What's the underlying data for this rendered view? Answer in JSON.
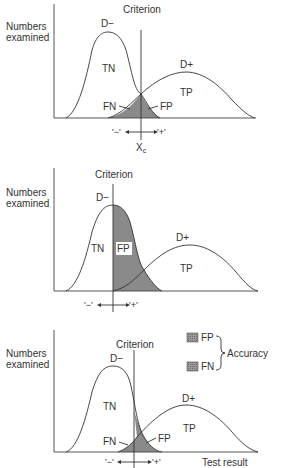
{
  "panels": [
    {
      "y_label_line1": "Numbers",
      "y_label_line2": "examined",
      "criterion_label": "Criterion",
      "d_minus": "D−",
      "d_plus": "D+",
      "tn": "TN",
      "tp": "TP",
      "fn": "FN",
      "fp": "FP",
      "neg_marker": "'−'",
      "pos_marker": "'+'",
      "criterion_value_label": "X",
      "criterion_value_sub": "c"
    },
    {
      "y_label_line1": "Numbers",
      "y_label_line2": "examined",
      "criterion_label": "Criterion",
      "d_minus": "D−",
      "d_plus": "D+",
      "tn": "TN",
      "tp": "TP",
      "fp": "FP",
      "neg_marker": "'−'",
      "pos_marker": "'+'"
    },
    {
      "y_label_line1": "Numbers",
      "y_label_line2": "examined",
      "criterion_label": "Criterion",
      "d_minus": "D−",
      "d_plus": "D+",
      "tn": "TN",
      "tp": "TP",
      "fn": "FN",
      "fp": "FP",
      "neg_marker": "'−'",
      "pos_marker": "'+'",
      "x_label": "Test result",
      "legend": {
        "fp": "FP",
        "fn": "FN",
        "group_label": "Accuracy"
      }
    }
  ],
  "colors": {
    "shade": "#8a8a8a",
    "line": "#333333",
    "background": "#ffffff"
  }
}
